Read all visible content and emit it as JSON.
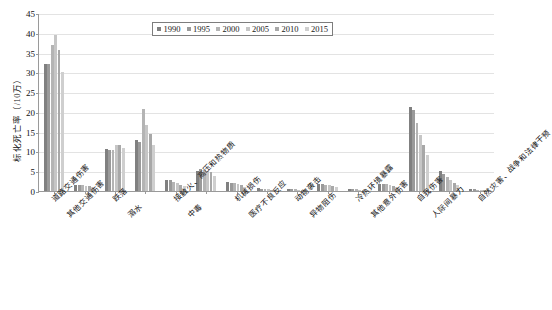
{
  "chart_data": {
    "type": "bar",
    "title": "",
    "xlabel": "",
    "ylabel": "标化死亡率（/10万）",
    "ylim": [
      0,
      45
    ],
    "yticks": [
      0,
      5,
      10,
      15,
      20,
      25,
      30,
      35,
      40,
      45
    ],
    "grid": true,
    "legend_position": "top-center",
    "categories": [
      "道路交通伤害",
      "其他交通伤害",
      "跌落",
      "溺水",
      "接触火、高压和热物质",
      "中毒",
      "机械损伤",
      "医疗不良反应",
      "动物袭击",
      "异物阻伤",
      "冷热环境暴露",
      "其他意外伤害",
      "自我伤害",
      "人际间暴力",
      "自然灾害、战争和法律干预"
    ],
    "series": [
      {
        "name": "1990",
        "color": "#808080",
        "values": [
          32.0,
          1.6,
          10.6,
          13.0,
          2.9,
          5.0,
          2.2,
          0.7,
          0.5,
          1.8,
          0.6,
          1.9,
          21.2,
          5.1,
          0.5
        ]
      },
      {
        "name": "1995",
        "color": "#9a9a9a",
        "values": [
          32.1,
          1.5,
          10.3,
          12.5,
          2.7,
          5.6,
          2.1,
          0.6,
          0.5,
          1.7,
          0.5,
          1.8,
          20.4,
          4.3,
          0.4
        ]
      },
      {
        "name": "2000",
        "color": "#b4b4b4",
        "values": [
          36.9,
          1.4,
          10.4,
          20.7,
          2.4,
          5.4,
          2.0,
          0.5,
          0.4,
          1.6,
          0.4,
          1.7,
          17.3,
          3.6,
          0.3
        ]
      },
      {
        "name": "2005",
        "color": "#c6c6c6",
        "values": [
          39.4,
          1.3,
          11.7,
          16.6,
          2.0,
          5.1,
          1.7,
          0.4,
          0.3,
          1.5,
          0.3,
          1.5,
          14.2,
          2.8,
          0.2
        ]
      },
      {
        "name": "2010",
        "color": "#a8a8a8",
        "values": [
          35.6,
          1.2,
          11.6,
          14.3,
          1.6,
          4.7,
          1.4,
          0.3,
          0.3,
          1.3,
          0.2,
          1.3,
          11.7,
          2.1,
          0.2
        ]
      },
      {
        "name": "2015",
        "color": "#cfcfcf",
        "values": [
          30.1,
          1.1,
          10.9,
          11.7,
          1.2,
          3.9,
          1.1,
          0.3,
          0.2,
          1.1,
          0.2,
          1.1,
          9.2,
          1.6,
          0.2
        ]
      }
    ]
  },
  "axis": {
    "y_title": "标化死亡率（/10万）"
  }
}
